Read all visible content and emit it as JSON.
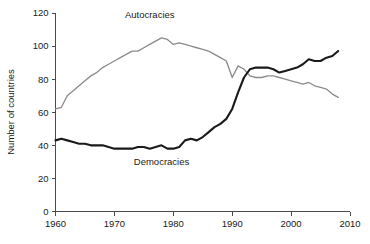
{
  "chart_data": {
    "type": "line",
    "title": "",
    "xlabel": "",
    "ylabel": "Number of countries",
    "xlim": [
      1960,
      2010
    ],
    "ylim": [
      0,
      120
    ],
    "xticks": [
      1960,
      1970,
      1980,
      1990,
      2000,
      2010
    ],
    "yticks": [
      0,
      20,
      40,
      60,
      80,
      100,
      120
    ],
    "grid": false,
    "legend_position": "inline-annotations",
    "annotations": [
      {
        "text": "Autocracies",
        "x": 1976,
        "y": 117,
        "series": "Autocracies"
      },
      {
        "text": "Democracies",
        "x": 1978,
        "y": 28,
        "series": "Democracies"
      }
    ],
    "x": [
      1960,
      1961,
      1962,
      1963,
      1964,
      1965,
      1966,
      1967,
      1968,
      1969,
      1970,
      1971,
      1972,
      1973,
      1974,
      1975,
      1976,
      1977,
      1978,
      1979,
      1980,
      1981,
      1982,
      1983,
      1984,
      1985,
      1986,
      1987,
      1988,
      1989,
      1990,
      1991,
      1992,
      1993,
      1994,
      1995,
      1996,
      1997,
      1998,
      1999,
      2000,
      2001,
      2002,
      2003,
      2004,
      2005,
      2006,
      2007,
      2008
    ],
    "series": [
      {
        "name": "Autocracies",
        "color": "#8c8c8c",
        "values": [
          62,
          63,
          70,
          73,
          76,
          79,
          82,
          84,
          87,
          89,
          91,
          93,
          95,
          97,
          97,
          99,
          101,
          103,
          105,
          104,
          101,
          102,
          101,
          100,
          99,
          98,
          97,
          95,
          93,
          91,
          81,
          88,
          86,
          82,
          81,
          81,
          82,
          82,
          81,
          80,
          79,
          78,
          77,
          78,
          76,
          75,
          74,
          71,
          69
        ]
      },
      {
        "name": "Democracies",
        "color": "#1a1a1a",
        "values": [
          43,
          44,
          43,
          42,
          41,
          41,
          40,
          40,
          40,
          39,
          38,
          38,
          38,
          38,
          39,
          39,
          38,
          39,
          40,
          38,
          38,
          39,
          43,
          44,
          43,
          45,
          48,
          51,
          53,
          56,
          62,
          72,
          81,
          86,
          87,
          87,
          87,
          86,
          84,
          85,
          86,
          87,
          89,
          92,
          91,
          91,
          93,
          94,
          97
        ]
      }
    ]
  },
  "axis": {
    "y_title": "Number of countries",
    "y_tick_labels": [
      "0",
      "20",
      "40",
      "60",
      "80",
      "100",
      "120"
    ],
    "x_tick_labels": [
      "1960",
      "1970",
      "1980",
      "1990",
      "2000",
      "2010"
    ]
  },
  "labels": {
    "autocracies": "Autocracies",
    "democracies": "Democracies"
  },
  "colors": {
    "autocracies_line": "#8c8c8c",
    "democracies_line": "#1a1a1a",
    "axis": "#4a4a4a",
    "text": "#1a1a1a",
    "background": "#ffffff"
  }
}
